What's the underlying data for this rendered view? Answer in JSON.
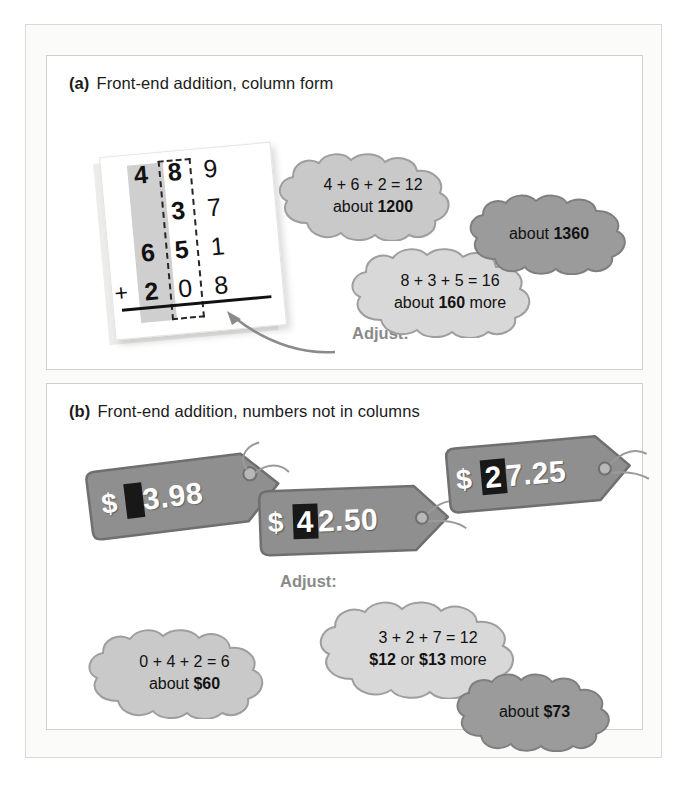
{
  "figure": {
    "panels": [
      {
        "id": "a",
        "label": "(a)",
        "title": "Front-end addition, column form",
        "column_problem": {
          "description": "column-form addition with hundreds column shaded and tens column boxed in dashes",
          "rows": [
            {
              "sign": "",
              "hundreds": "4",
              "tens": "8",
              "ones": "9"
            },
            {
              "sign": "",
              "hundreds": "",
              "tens": "3",
              "ones": "7"
            },
            {
              "sign": "",
              "hundreds": "6",
              "tens": "5",
              "ones": "1"
            },
            {
              "sign": "+",
              "hundreds": "2",
              "tens": "0",
              "ones": "8"
            }
          ]
        },
        "adjust_label": "Adjust:",
        "clouds": [
          {
            "name": "front-end-sum-cloud",
            "shade": "light",
            "line1": "4 + 6 + 2 = 12",
            "line2_prefix": "about ",
            "line2_bold": "1200",
            "line2_suffix": ""
          },
          {
            "name": "adjust-sum-cloud",
            "shade": "light",
            "line1": "8 + 3 + 5 = 16",
            "line2_prefix": "about ",
            "line2_bold": "160",
            "line2_suffix": " more"
          },
          {
            "name": "final-estimate-cloud",
            "shade": "dark",
            "line1": "",
            "line2_prefix": "about ",
            "line2_bold": "1360",
            "line2_suffix": ""
          }
        ]
      },
      {
        "id": "b",
        "label": "(b)",
        "title": "Front-end addition, numbers not in columns",
        "adjust_label": "Adjust:",
        "price_tags": [
          {
            "name": "price-tag-1",
            "currency": "$",
            "boxed_digits": "",
            "rest_digits": "3.98",
            "full_value": "$3.98"
          },
          {
            "name": "price-tag-2",
            "currency": "$",
            "boxed_digits": "4",
            "rest_digits": "2.50",
            "full_value": "$42.50"
          },
          {
            "name": "price-tag-3",
            "currency": "$",
            "boxed_digits": "2",
            "rest_digits": "7.25",
            "full_value": "$27.25"
          }
        ],
        "clouds": [
          {
            "name": "front-end-sum-cloud",
            "shade": "light",
            "line1": "0 + 4 + 2 = 6",
            "line2_prefix": "about ",
            "line2_bold": "$60",
            "line2_suffix": ""
          },
          {
            "name": "adjust-sum-cloud",
            "shade": "light",
            "line1": "3 + 2 + 7 = 12",
            "line2_prefix": "",
            "line2_bold": "$12",
            "line2_mid": " or ",
            "line2_bold2": "$13",
            "line2_suffix": " more"
          },
          {
            "name": "final-estimate-cloud",
            "shade": "dark",
            "line1": "",
            "line2_prefix": "about ",
            "line2_bold": "$73",
            "line2_suffix": ""
          }
        ]
      }
    ]
  },
  "colors": {
    "cloud_light_fill": "#c9c9c9",
    "cloud_light_fill_b": "#dcdcdc",
    "cloud_dark_fill": "#9b9b9b",
    "cloud_stroke": "#9e9e9e",
    "tag_fill": "#8f8f8f",
    "tag_stroke": "#6f6f6f",
    "highlight_band": "#cfcfcf",
    "adjust_text": "#8a8a8a",
    "digit_text": "#111111"
  }
}
